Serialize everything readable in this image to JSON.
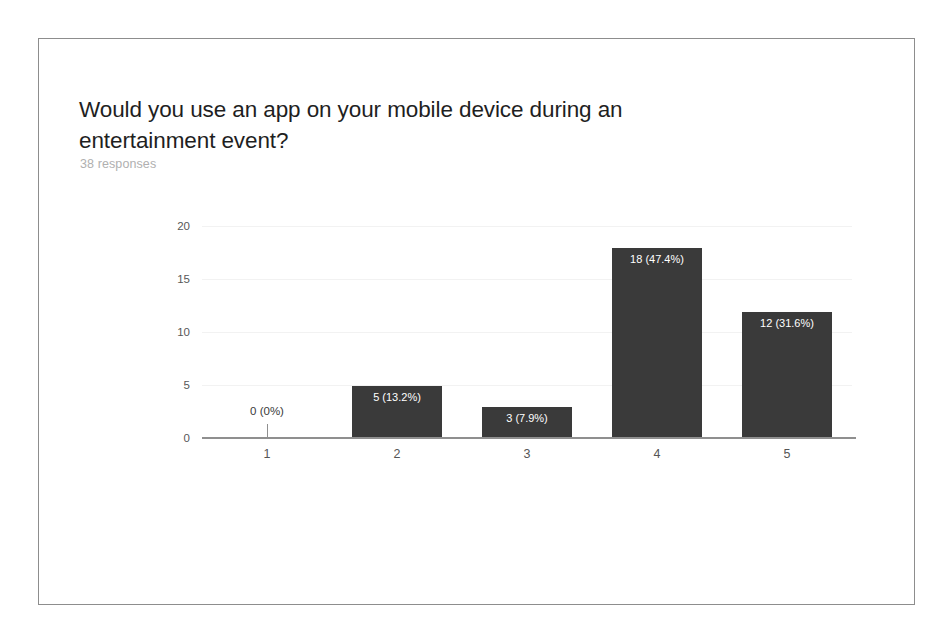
{
  "card": {
    "title": "Would you use an app on your mobile device during an entertainment event?",
    "response_count": "38 responses"
  },
  "colors": {
    "bar_fill": "#3a3a3a",
    "bar_label_text": "#ffffff",
    "zero_label_text": "#3a3a3a",
    "axis": "#8f8f8f",
    "gridline": "#f2f2f2",
    "title_text": "#1f1f1f",
    "subtitle_text": "#b0b0b0",
    "frame_border": "#8d8d8d",
    "page_background": "#ffffff"
  },
  "chart_data": {
    "type": "bar",
    "title": "Would you use an app on your mobile device during an entertainment event?",
    "subtitle": "38 responses",
    "xlabel": "",
    "ylabel": "",
    "categories": [
      "1",
      "2",
      "3",
      "4",
      "5"
    ],
    "values": [
      0,
      5,
      3,
      18,
      12
    ],
    "percentages": [
      "0%",
      "13.2%",
      "7.9%",
      "47.4%",
      "31.6%"
    ],
    "bar_labels": [
      "0 (0%)",
      "5 (13.2%)",
      "3 (7.9%)",
      "18 (47.4%)",
      "12 (31.6%)"
    ],
    "total_responses": 38,
    "ylim": [
      0,
      20
    ],
    "yticks": [
      "0",
      "5",
      "10",
      "15",
      "20"
    ],
    "ytick_values": [
      0,
      5,
      10,
      15,
      20
    ],
    "grid": true,
    "legend": false
  }
}
